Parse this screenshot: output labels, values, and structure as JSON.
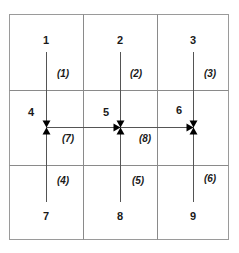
{
  "diagram": {
    "type": "grid-flow-network",
    "rows": 3,
    "cols": 3,
    "nodes": [
      {
        "id": "1",
        "label": "1",
        "row": 0,
        "col": 0
      },
      {
        "id": "2",
        "label": "2",
        "row": 0,
        "col": 1
      },
      {
        "id": "3",
        "label": "3",
        "row": 0,
        "col": 2
      },
      {
        "id": "4",
        "label": "4",
        "row": 1,
        "col": 0
      },
      {
        "id": "5",
        "label": "5",
        "row": 1,
        "col": 1
      },
      {
        "id": "6",
        "label": "6",
        "row": 1,
        "col": 2
      },
      {
        "id": "7",
        "label": "7",
        "row": 2,
        "col": 0
      },
      {
        "id": "8",
        "label": "8",
        "row": 2,
        "col": 1
      },
      {
        "id": "9",
        "label": "9",
        "row": 2,
        "col": 2
      }
    ],
    "edges": [
      {
        "label": "(1)",
        "from": "1",
        "to": "4"
      },
      {
        "label": "(2)",
        "from": "2",
        "to": "5"
      },
      {
        "label": "(3)",
        "from": "3",
        "to": "6"
      },
      {
        "label": "(4)",
        "from": "7",
        "to": "4"
      },
      {
        "label": "(5)",
        "from": "8",
        "to": "5"
      },
      {
        "label": "(6)",
        "from": "9",
        "to": "6"
      },
      {
        "label": "(7)",
        "from": "4",
        "to": "5"
      },
      {
        "label": "(8)",
        "from": "5",
        "to": "6"
      }
    ],
    "colors": {
      "grid": "#8a8a8a",
      "line": "#555555",
      "arrow": "#000000",
      "text": "#1a1a1a"
    }
  }
}
